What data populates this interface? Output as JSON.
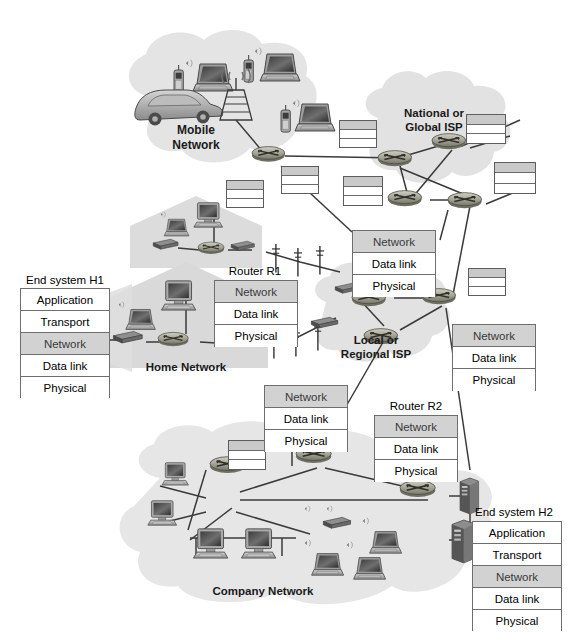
{
  "figure": {
    "type": "network-architecture-diagram"
  },
  "layer_names": {
    "application": "Application",
    "transport": "Transport",
    "network": "Network",
    "datalink": "Data link",
    "physical": "Physical"
  },
  "regions": [
    {
      "id": "mobile",
      "label": "Mobile\nNetwork"
    },
    {
      "id": "national",
      "label": "National or\nGlobal ISP"
    },
    {
      "id": "local",
      "label": "Local or\nRegional ISP"
    },
    {
      "id": "home",
      "label": "Home Network"
    },
    {
      "id": "company",
      "label": "Company Network"
    }
  ],
  "stacks": [
    {
      "id": "h1",
      "title": "End system H1",
      "layers": [
        "Application",
        "Transport",
        "Network",
        "Data link",
        "Physical"
      ],
      "highlighted": "Network"
    },
    {
      "id": "r1",
      "title": "Router R1",
      "layers": [
        "Network",
        "Data link",
        "Physical"
      ],
      "highlighted": "Network"
    },
    {
      "id": "isp-top",
      "title": "",
      "layers": [
        "Network",
        "Data link",
        "Physical"
      ],
      "highlighted": "Network"
    },
    {
      "id": "isp-right",
      "title": "",
      "layers": [
        "Network",
        "Data link",
        "Physical"
      ],
      "highlighted": "Network"
    },
    {
      "id": "company-top",
      "title": "",
      "layers": [
        "Network",
        "Data link",
        "Physical"
      ],
      "highlighted": "Network"
    },
    {
      "id": "r2",
      "title": "Router R2",
      "layers": [
        "Network",
        "Data link",
        "Physical"
      ],
      "highlighted": "Network"
    },
    {
      "id": "h2",
      "title": "End system H2",
      "layers": [
        "Application",
        "Transport",
        "Network",
        "Data link",
        "Physical"
      ],
      "highlighted": "Network"
    }
  ],
  "icons": {
    "router": "router-icon",
    "laptop": "laptop-icon",
    "desktop": "desktop-computer-icon",
    "mobile_phone": "mobile-phone-icon",
    "car": "car-icon",
    "cell_tower": "cell-tower-icon",
    "utility_pole": "utility-pole-icon",
    "modem": "modem-icon",
    "wireless_access_point": "wireless-access-point-icon",
    "server_rack": "server-rack-icon",
    "server_tower": "server-tower-icon",
    "house": "house-icon",
    "cloud": "cloud-icon",
    "wifi_waves": "wifi-signal-icon"
  },
  "colors": {
    "stack_border": "#6e6e6e",
    "stack_fill": "#ffffff",
    "network_highlight": "#d2d2d2",
    "cloud_fill": "#e3e3e3",
    "house_fill": "#d8d8d8",
    "link_line": "#3a3a3a",
    "router_body": "#9a9a8c",
    "text": "#000000",
    "background": "#ffffff"
  }
}
